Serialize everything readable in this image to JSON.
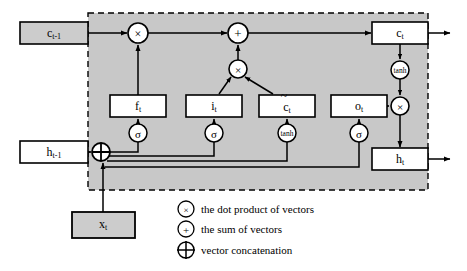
{
  "figure": {
    "type": "lstm-cell-diagram",
    "title": "",
    "cell_border_style": "dashed",
    "cell_fill": "#c8c8c8",
    "background": "#ffffff"
  },
  "colors": {
    "cell_background": "#c8c8c8",
    "box_fill_outside": "#cccccc",
    "box_fill_inside": "#ffffff",
    "node_fill": "#ffffff",
    "stroke": "#000000",
    "page_background": "#ffffff"
  },
  "external_boxes": [
    {
      "id": "c_prev",
      "name": "c-prev-box",
      "base": "c",
      "sub": "t-1",
      "x": 20,
      "y": 22,
      "w": 68,
      "h": 22
    },
    {
      "id": "h_prev",
      "name": "h-prev-box",
      "base": "h",
      "sub": "t-1",
      "x": 20,
      "y": 141,
      "w": 68,
      "h": 22
    },
    {
      "id": "x_t",
      "name": "x-t-box",
      "base": "x",
      "sub": "t",
      "x": 72,
      "y": 212,
      "w": 63,
      "h": 26
    }
  ],
  "gate_boxes": [
    {
      "id": "f_t",
      "name": "forget-gate-box",
      "base": "f",
      "sub": "t",
      "tilde": false,
      "x": 110,
      "y": 95,
      "w": 56,
      "h": 22
    },
    {
      "id": "i_t",
      "name": "input-gate-box",
      "base": "i",
      "sub": "t",
      "tilde": false,
      "x": 186,
      "y": 95,
      "w": 56,
      "h": 22
    },
    {
      "id": "c_tilde",
      "name": "candidate-cell-box",
      "base": "c",
      "sub": "t",
      "tilde": true,
      "x": 259,
      "y": 95,
      "w": 56,
      "h": 22
    },
    {
      "id": "o_t",
      "name": "output-gate-box",
      "base": "o",
      "sub": "t",
      "tilde": false,
      "x": 331,
      "y": 95,
      "w": 56,
      "h": 22
    }
  ],
  "state_boxes": [
    {
      "id": "c_out",
      "name": "c-t-box",
      "base": "c",
      "sub": "t",
      "x": 372,
      "y": 22,
      "w": 56,
      "h": 22
    },
    {
      "id": "h_out",
      "name": "h-t-box",
      "base": "h",
      "sub": "t",
      "x": 372,
      "y": 148,
      "w": 56,
      "h": 22
    }
  ],
  "activation_nodes": [
    {
      "id": "sigma_f",
      "name": "sigmoid-node-forget",
      "glyph": "σ",
      "label": "sigma",
      "cx": 138,
      "cy": 133,
      "r": 9
    },
    {
      "id": "sigma_i",
      "name": "sigmoid-node-input",
      "glyph": "σ",
      "label": "sigma",
      "cx": 214,
      "cy": 133,
      "r": 9
    },
    {
      "id": "tanh_c",
      "name": "tanh-node-candidate",
      "glyph": "tanh",
      "label": "tanh",
      "cx": 287,
      "cy": 133,
      "r": 9
    },
    {
      "id": "sigma_o",
      "name": "sigmoid-node-output",
      "glyph": "σ",
      "label": "sigma",
      "cx": 359,
      "cy": 133,
      "r": 9
    },
    {
      "id": "tanh_out",
      "name": "tanh-node-cell-state",
      "glyph": "tanh",
      "label": "tanh",
      "cx": 400,
      "cy": 70,
      "r": 9
    }
  ],
  "operator_nodes": [
    {
      "id": "mul_forget",
      "name": "multiply-node-forget",
      "op": "×",
      "cx": 138,
      "cy": 33,
      "r": 10
    },
    {
      "id": "add_cell",
      "name": "add-node-cell-state",
      "op": "+",
      "cx": 238,
      "cy": 33,
      "r": 10
    },
    {
      "id": "mul_input",
      "name": "multiply-node-input",
      "op": "×",
      "cx": 238,
      "cy": 69,
      "r": 9
    },
    {
      "id": "mul_output",
      "name": "multiply-node-output",
      "op": "×",
      "cx": 400,
      "cy": 106,
      "r": 9
    }
  ],
  "concat_node": {
    "id": "concat",
    "name": "vector-concatenation-node",
    "op": "⊕",
    "cx": 101,
    "cy": 152,
    "r": 9
  },
  "legend": {
    "name": "legend",
    "items": [
      {
        "id": "dot-product",
        "name": "legend-item-dot-product",
        "symbol": "dot-product-icon",
        "glyph": "×",
        "text": "the dot product of vectors"
      },
      {
        "id": "sum",
        "name": "legend-item-sum",
        "symbol": "sum-icon",
        "glyph": "+",
        "text": "the sum of vectors"
      },
      {
        "id": "concatenation",
        "name": "legend-item-concatenation",
        "symbol": "concatenation-icon",
        "glyph": "⊕",
        "text": "vector concatenation"
      }
    ]
  },
  "outputs": [
    {
      "id": "c_out_arrow",
      "name": "cell-state-output-arrow",
      "from_x": 428,
      "to_x": 452,
      "y": 33
    },
    {
      "id": "h_out_arrow",
      "name": "hidden-state-output-arrow",
      "from_x": 428,
      "to_x": 452,
      "y": 159
    }
  ],
  "cell_rect": {
    "x": 88,
    "y": 13,
    "w": 340,
    "h": 177
  }
}
